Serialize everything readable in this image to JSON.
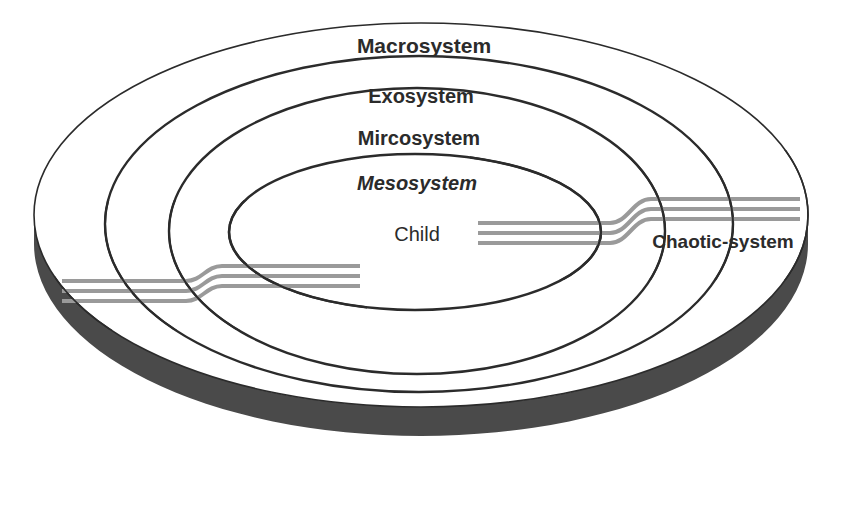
{
  "diagram": {
    "background_color": "#ffffff",
    "ring_stroke_color": "#2b2b2b",
    "ribbon_color": "#9a9a9a",
    "chronosystem_band_color": "#4a4a4a",
    "chronosystem_text_color": "#ffffff",
    "label_text_color": "#2b2b2b"
  },
  "rings": [
    {
      "id": "macrosystem",
      "label": "Macrosystem",
      "style": "bold",
      "label_x": 424,
      "label_y": 53,
      "font_size": 21,
      "cx": 421,
      "cy": 215,
      "rx": 387,
      "ry": 192,
      "stroke_width": 1.6
    },
    {
      "id": "exosystem",
      "label": "Exosystem",
      "style": "bold",
      "label_x": 421,
      "label_y": 103,
      "font_size": 20,
      "cx": 419,
      "cy": 224,
      "rx": 314,
      "ry": 168,
      "stroke_width": 2.4
    },
    {
      "id": "mircosystem",
      "label": "Mircosystem",
      "style": "bold",
      "label_x": 419,
      "label_y": 145,
      "font_size": 20,
      "cx": 417,
      "cy": 231,
      "rx": 248,
      "ry": 143,
      "stroke_width": 2.4
    },
    {
      "id": "mesosystem",
      "label": "Mesosystem",
      "style": "bold-italic",
      "label_x": 417,
      "label_y": 190,
      "font_size": 20,
      "cx": 415,
      "cy": 232,
      "rx": 186,
      "ry": 78,
      "stroke_width": 2.6
    },
    {
      "id": "child",
      "label": "Child",
      "style": "plain",
      "label_x": 417,
      "label_y": 241,
      "font_size": 20,
      "cx": null,
      "cy": null,
      "rx": null,
      "ry": null,
      "stroke_width": 0
    }
  ],
  "annotations": {
    "chaotic_system": {
      "label": "Chaotic-system",
      "style": "bold",
      "label_x": 723,
      "label_y": 248,
      "font_size": 19
    },
    "chronosystem": {
      "label": "Chronosystem",
      "style": "bold",
      "label_x": 424,
      "label_y": 480,
      "font_size": 21
    }
  },
  "ribbon": {
    "name": "chaotic-system-ribbon",
    "color": "#9a9a9a",
    "line_count": 3,
    "line_width": 4,
    "gap": 7,
    "segments": [
      {
        "id": "left-segment",
        "from_x": 62,
        "to_x": 360,
        "note": "enters from outside at left, steps up crossing mesosystem boundary"
      },
      {
        "id": "right-segment",
        "from_x": 478,
        "to_x": 800,
        "note": "exits to the right, steps up crossing outer boundaries"
      }
    ]
  }
}
